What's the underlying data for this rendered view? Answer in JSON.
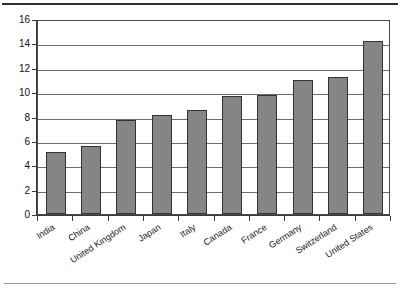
{
  "chart_data": {
    "type": "bar",
    "title": "",
    "subtitle": "",
    "xlabel": "",
    "ylabel": "",
    "ylim": [
      0,
      16
    ],
    "ytick_step": 2,
    "yticks": [
      0,
      2,
      4,
      6,
      8,
      10,
      12,
      14,
      16
    ],
    "ytick_labels": [
      "0",
      "2",
      "4",
      "6",
      "8",
      "10",
      "12",
      "14",
      "16"
    ],
    "grid": true,
    "grid_axis": "y",
    "legend": false,
    "legend_position": "none",
    "categories": [
      "India",
      "China",
      "United Kingdom",
      "Japan",
      "Italy",
      "Canada",
      "France",
      "Germany",
      "Switzerland",
      "United States"
    ],
    "values": [
      5.1,
      5.55,
      7.7,
      8.1,
      8.55,
      9.65,
      9.8,
      11.0,
      11.25,
      14.2
    ],
    "bar_color": "#858585",
    "bar_edge_color": "#333333",
    "axis_color": "#3a3a3a",
    "grid_color": "#6e6e6e",
    "background_color": "#ffffff"
  },
  "decorations": {
    "top_rule_color": "#2e2e2e",
    "bottom_rule_color": "#9a9a9a"
  }
}
